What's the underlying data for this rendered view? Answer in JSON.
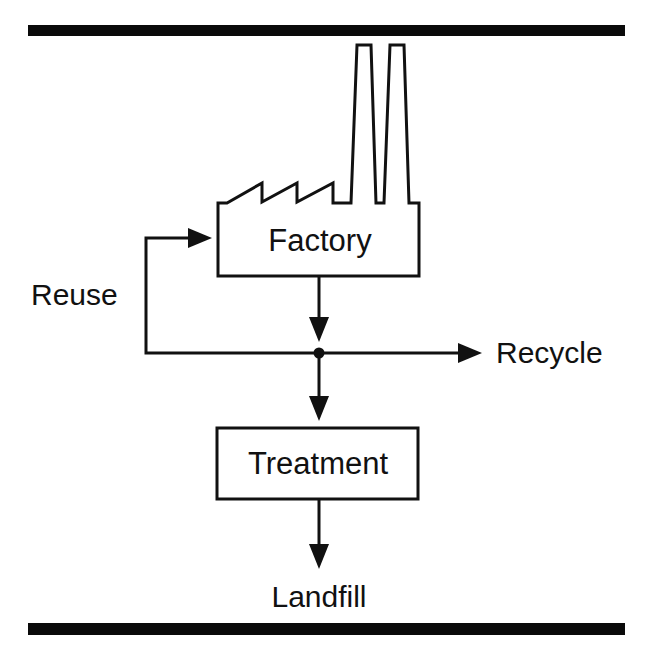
{
  "diagram": {
    "nodes": {
      "factory": {
        "label": "Factory",
        "shape": "factory-building-with-chimneys"
      },
      "treatment": {
        "label": "Treatment",
        "shape": "rectangle"
      }
    },
    "edge_labels": {
      "reuse": "Reuse",
      "recycle": "Recycle",
      "landfill": "Landfill"
    },
    "edges": [
      {
        "from": "Factory",
        "to": "junction"
      },
      {
        "from": "junction",
        "to": "Factory",
        "label": "Reuse"
      },
      {
        "from": "junction",
        "to": "Recycle",
        "label": "Recycle"
      },
      {
        "from": "junction",
        "to": "Treatment"
      },
      {
        "from": "Treatment",
        "to": "Landfill",
        "label": "Landfill"
      }
    ],
    "colors": {
      "stroke": "#111111",
      "background": "#ffffff",
      "rule": "#0a0a0a"
    }
  }
}
